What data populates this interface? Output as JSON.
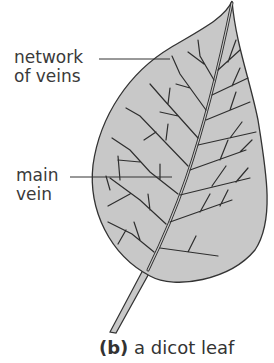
{
  "figure": {
    "labels": {
      "network_of_veins": {
        "line1": "network",
        "line2": "of veins"
      },
      "main_vein": {
        "line1": "main",
        "line2": "vein"
      }
    },
    "caption": {
      "marker": "(b)",
      "text": "a dicot leaf"
    },
    "colors": {
      "leaf_fill": "#c8c8c8",
      "outline": "#333333",
      "vein": "#2e2e2e",
      "background": "#ffffff"
    }
  }
}
